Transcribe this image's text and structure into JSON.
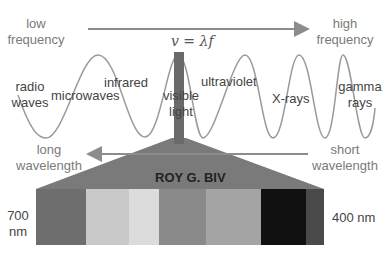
{
  "title_equation": "v = λf",
  "frequency_axis": {
    "left_label_line1": "low",
    "left_label_line2": "frequency",
    "right_label_line1": "high",
    "right_label_line2": "frequency",
    "arrow_direction": "right"
  },
  "wavelength_axis": {
    "left_label_line1": "long",
    "left_label_line2": "wavelength",
    "right_label_line1": "short",
    "right_label_line2": "wavelength",
    "arrow_direction": "left"
  },
  "regions": [
    {
      "label_line1": "radio",
      "label_line2": "waves"
    },
    {
      "label_line1": "microwaves",
      "label_line2": ""
    },
    {
      "label_line1": "infrared",
      "label_line2": ""
    },
    {
      "label_line1": "visible",
      "label_line2": "light"
    },
    {
      "label_line1": "ultraviolet",
      "label_line2": ""
    },
    {
      "label_line1": "X-rays",
      "label_line2": ""
    },
    {
      "label_line1": "gamma",
      "label_line2": "rays"
    }
  ],
  "spectrum": {
    "mnemonic": "ROY G. BIV",
    "left_label_line1": "700",
    "left_label_line2": "nm",
    "right_label": "400 nm",
    "bands": [
      {
        "name": "red",
        "color": "#6e6e6e"
      },
      {
        "name": "orange",
        "color": "#c9c9c9"
      },
      {
        "name": "yellow",
        "color": "#dcdcdc"
      },
      {
        "name": "green",
        "color": "#8a8a8a"
      },
      {
        "name": "blue",
        "color": "#a4a4a4"
      },
      {
        "name": "indigo",
        "color": "#111111"
      },
      {
        "name": "violet",
        "color": "#4a4a4a"
      }
    ]
  },
  "colors": {
    "arrow": "#8c8c8c",
    "wave": "#9a9a9a",
    "visible_bar": "#6a6a6a",
    "funnel": "#7a7a7a"
  }
}
